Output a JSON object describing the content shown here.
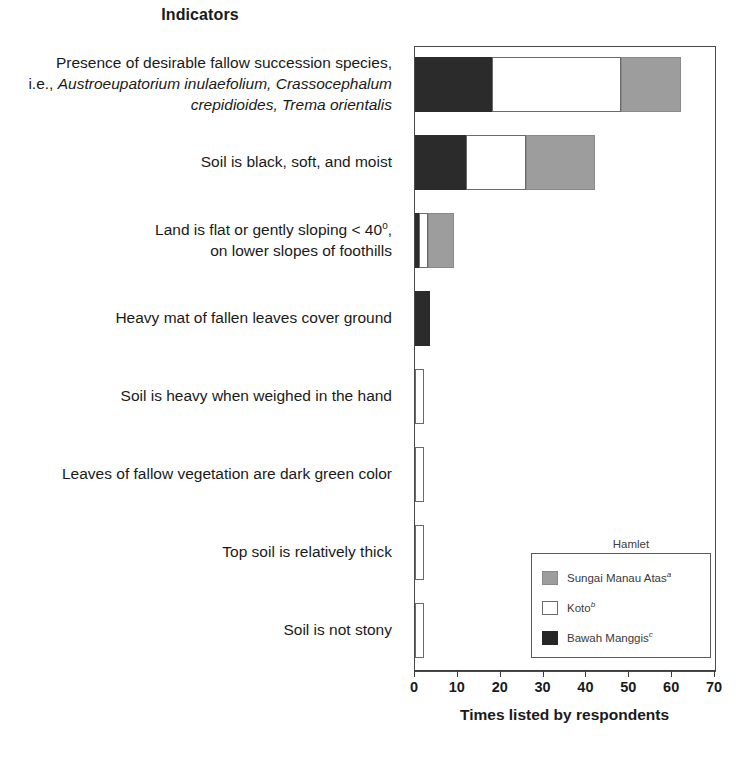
{
  "header": {
    "column_title": "Indicators"
  },
  "axis": {
    "x_title": "Times listed by respondents",
    "x_ticks": [
      "0",
      "10",
      "20",
      "30",
      "40",
      "50",
      "60",
      "70"
    ]
  },
  "legend": {
    "title": "Hamlet",
    "items": [
      {
        "label": "Sungai Manau Atas",
        "note": "a",
        "swatch": "gray",
        "color": "#9d9d9d"
      },
      {
        "label": "Koto",
        "note": "b",
        "swatch": "white",
        "color": "#ffffff"
      },
      {
        "label": "Bawah Manggis",
        "note": "c",
        "swatch": "black",
        "color": "#262626"
      }
    ]
  },
  "categories_text": [
    {
      "lines": [
        {
          "parts": [
            {
              "t": "Presence of desirable fallow succession species,",
              "style": "normal"
            }
          ]
        },
        {
          "parts": [
            {
              "t": "i.e., ",
              "style": "normal"
            },
            {
              "t": "Austroeupatorium inulaefolium, Crassocephalum",
              "style": "italic"
            }
          ]
        },
        {
          "parts": [
            {
              "t": "crepidioides, Trema orientalis",
              "style": "italic"
            }
          ]
        }
      ]
    },
    {
      "lines": [
        {
          "parts": [
            {
              "t": "Soil is black, soft, and moist",
              "style": "normal"
            }
          ]
        }
      ]
    },
    {
      "lines": [
        {
          "parts": [
            {
              "t": "Land is flat or gently sloping < 40",
              "style": "normal"
            },
            {
              "t": "o",
              "style": "sup"
            },
            {
              "t": ",",
              "style": "normal"
            }
          ]
        },
        {
          "parts": [
            {
              "t": "on lower slopes of foothills",
              "style": "normal"
            }
          ]
        }
      ]
    },
    {
      "lines": [
        {
          "parts": [
            {
              "t": "Heavy mat of fallen leaves cover ground",
              "style": "normal"
            }
          ]
        }
      ]
    },
    {
      "lines": [
        {
          "parts": [
            {
              "t": "Soil is heavy when weighed in the hand",
              "style": "normal"
            }
          ]
        }
      ]
    },
    {
      "lines": [
        {
          "parts": [
            {
              "t": "Leaves of fallow vegetation are dark green color",
              "style": "normal"
            }
          ]
        }
      ]
    },
    {
      "lines": [
        {
          "parts": [
            {
              "t": "Top soil is relatively thick",
              "style": "normal"
            }
          ]
        }
      ]
    },
    {
      "lines": [
        {
          "parts": [
            {
              "t": "Soil is not stony",
              "style": "normal"
            }
          ]
        }
      ]
    }
  ],
  "chart_data": {
    "type": "bar",
    "orientation": "horizontal",
    "stacked": true,
    "title": "Indicators",
    "xlabel": "Times listed by respondents",
    "ylabel": "Indicators",
    "xlim": [
      0,
      70
    ],
    "xticks": [
      0,
      10,
      20,
      30,
      40,
      50,
      60,
      70
    ],
    "grid": false,
    "legend_title": "Hamlet",
    "legend_position": "inside-lower-right",
    "categories": [
      "Presence of desirable fallow succession species, i.e., Austroeupatorium inulaefolium, Crassocephalum crepidioides, Trema orientalis",
      "Soil is black, soft, and moist",
      "Land is flat or gently sloping < 40o, on lower slopes of foothills",
      "Heavy mat of fallen leaves cover ground",
      "Soil is heavy when weighed in the hand",
      "Leaves of fallow vegetation are dark green color",
      "Top soil is relatively thick",
      "Soil is not stony"
    ],
    "series": [
      {
        "name": "Bawah Manggis",
        "color": "#2b2b2b",
        "values": [
          18,
          12,
          1,
          3.5,
          0,
          0,
          0,
          0
        ]
      },
      {
        "name": "Koto",
        "color": "#ffffff",
        "values": [
          30,
          14,
          2,
          0,
          2,
          2,
          2,
          2
        ]
      },
      {
        "name": "Sungai Manau Atas",
        "color": "#9d9d9d",
        "values": [
          14,
          16,
          6,
          0,
          0,
          0,
          0,
          0
        ]
      }
    ],
    "totals": [
      62,
      42,
      9,
      3.5,
      2,
      2,
      2,
      2
    ]
  }
}
